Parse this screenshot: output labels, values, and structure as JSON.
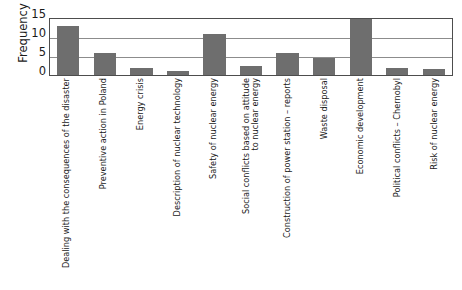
{
  "chart_data": {
    "type": "bar",
    "title": "",
    "subtitle": "",
    "xlabel": "",
    "ylabel": "Frequency",
    "ylim": [
      0,
      15
    ],
    "yticks": [
      0,
      5,
      10,
      15
    ],
    "grid": true,
    "legend": null,
    "bar_color": "#6e6e6e",
    "frame_color": "#4d4d4d",
    "gridline_color": "#8c8c8c",
    "categories": [
      "Dealing with the consequences of the disaster",
      "Preventive action in Poland",
      "Energy crisis",
      "Description of nuclear technology",
      "Safety of nuclear energy",
      "Social conflicts based on attitude to nuclear energy",
      "Construction of power station – reports",
      "Waste disposal",
      "Economic development",
      "Political conflicts – Chernobyl",
      "Risk of nuclear energy"
    ],
    "category_lines": [
      [
        "Dealing with the consequences of the disaster"
      ],
      [
        "Preventive action in Poland"
      ],
      [
        "Energy crisis"
      ],
      [
        "Description of nuclear technology"
      ],
      [
        "Safety of nuclear energy"
      ],
      [
        "Social conflicts based on attitude",
        "to nuclear energy"
      ],
      [
        "Construction of power station – reports"
      ],
      [
        "Waste disposal"
      ],
      [
        "Economic development"
      ],
      [
        "Political conflicts – Chernobyl"
      ],
      [
        "Risk of nuclear energy"
      ]
    ],
    "values": [
      13,
      6,
      2,
      1,
      11,
      2.5,
      6,
      4.5,
      15,
      2,
      1.5
    ]
  },
  "ytick_labels": [
    "15",
    "10",
    "5",
    "0"
  ]
}
